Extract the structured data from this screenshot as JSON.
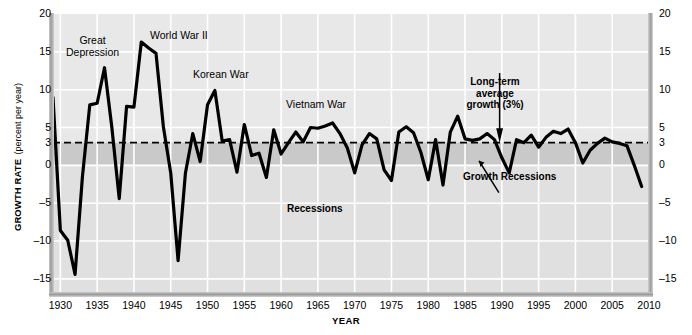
{
  "chart_data": {
    "type": "line",
    "title": "",
    "xlabel": "YEAR",
    "ylabel_main": "GROWTH RATE",
    "ylabel_sub": "(percent per year)",
    "xlim": [
      1929,
      2010
    ],
    "ylim": [
      -17,
      20
    ],
    "xticks": [
      1930,
      1935,
      1940,
      1945,
      1950,
      1955,
      1960,
      1965,
      1970,
      1975,
      1980,
      1985,
      1990,
      1995,
      2000,
      2005,
      2010
    ],
    "yticks": [
      20,
      15,
      10,
      5,
      3,
      0,
      -5,
      -10,
      -15
    ],
    "ytick_labels": [
      "20",
      "15",
      "10",
      "5",
      "3",
      "0",
      "-5",
      "-10",
      "-15"
    ],
    "grid": true,
    "legend_position": "none",
    "reference_line": {
      "label": "Long-term average growth (3%)",
      "value": 3,
      "style": "dashed"
    },
    "bands": [
      {
        "name": "Recessions",
        "from": -17,
        "to": 0,
        "color": "#e0e0e0"
      },
      {
        "name": "Growth Recessions",
        "from": 0,
        "to": 3,
        "color": "#c9c9c9"
      }
    ],
    "series": [
      {
        "name": "Real GDP growth rate",
        "color": "#000000",
        "x": [
          1929,
          1930,
          1931,
          1932,
          1933,
          1934,
          1935,
          1936,
          1937,
          1938,
          1939,
          1940,
          1941,
          1942,
          1943,
          1944,
          1945,
          1946,
          1947,
          1948,
          1949,
          1950,
          1951,
          1952,
          1953,
          1954,
          1955,
          1956,
          1957,
          1958,
          1959,
          1960,
          1961,
          1962,
          1963,
          1964,
          1965,
          1966,
          1967,
          1968,
          1969,
          1970,
          1971,
          1972,
          1973,
          1974,
          1975,
          1976,
          1977,
          1978,
          1979,
          1980,
          1981,
          1982,
          1983,
          1984,
          1985,
          1986,
          1987,
          1988,
          1989,
          1990,
          1991,
          1992,
          1993,
          1994,
          1995,
          1996,
          1997,
          1998,
          1999,
          2000,
          2001,
          2002,
          2003,
          2004,
          2005,
          2006,
          2007,
          2008,
          2009
        ],
        "values": [
          9.0,
          -8.6,
          -9.9,
          -14.4,
          -1.5,
          8.0,
          8.2,
          12.9,
          5.0,
          -4.4,
          7.8,
          7.7,
          16.3,
          15.5,
          14.8,
          5.1,
          -1.0,
          -12.6,
          -1.0,
          4.2,
          0.5,
          8.0,
          9.9,
          3.2,
          3.4,
          -0.9,
          5.4,
          1.3,
          1.6,
          -1.6,
          4.7,
          1.5,
          3.0,
          4.4,
          3.1,
          5.0,
          4.9,
          5.2,
          5.6,
          4.2,
          2.3,
          -1.0,
          2.7,
          4.2,
          3.5,
          -0.6,
          -2.0,
          4.4,
          5.1,
          4.3,
          1.7,
          -1.9,
          3.4,
          -2.6,
          4.4,
          6.5,
          3.5,
          3.3,
          3.5,
          4.2,
          3.4,
          1.0,
          -1.0,
          3.4,
          3.0,
          4.0,
          2.4,
          3.7,
          4.5,
          4.2,
          4.8,
          3.0,
          0.3,
          2.0,
          2.9,
          3.6,
          3.1,
          2.9,
          2.6,
          0.0,
          -2.8
        ],
        "y_at_3pct_ref": 3
      }
    ],
    "annotations": [
      {
        "name": "great-depression",
        "text_line1": "Great",
        "text_line2": "Depression",
        "x": 1932.5,
        "y": 14
      },
      {
        "name": "world-war-ii",
        "text": "World War II",
        "x": 1942,
        "y": 17.5
      },
      {
        "name": "korean-war",
        "text": "Korean War",
        "x": 1952,
        "y": 11.5
      },
      {
        "name": "vietnam-war",
        "text": "Vietnam War",
        "x": 1966,
        "y": 8.5
      },
      {
        "name": "long-term-average",
        "text_line1": "Long-term",
        "text_line2": "average",
        "text_line3": "growth (3%)",
        "x": 1988,
        "y": 11,
        "has_arrow": true
      },
      {
        "name": "growth-recessions",
        "text": "Growth Recessions",
        "x": 1990,
        "y": -2.5,
        "has_arrow": true
      },
      {
        "name": "recessions",
        "text": "Recessions",
        "x": 1966,
        "y": -9.5
      }
    ]
  },
  "axis": {
    "y_title_main": "GROWTH RATE",
    "y_title_sub": "(percent per year)",
    "x_title": "YEAR",
    "ytick_labels": [
      "20",
      "15",
      "10",
      "5",
      "3",
      "0",
      "–5",
      "–10",
      "–15"
    ],
    "xtick_labels": [
      "1930",
      "1935",
      "1940",
      "1945",
      "1950",
      "1955",
      "1960",
      "1965",
      "1970",
      "1975",
      "1980",
      "1985",
      "1990",
      "1995",
      "2000",
      "2005",
      "2010"
    ]
  },
  "annotations": {
    "great_depression_l1": "Great",
    "great_depression_l2": "Depression",
    "world_war_ii": "World War II",
    "korean_war": "Korean War",
    "vietnam_war": "Vietnam War",
    "long_term_l1": "Long-term",
    "long_term_l2": "average",
    "long_term_l3": "growth (3%)",
    "growth_recessions": "Growth Recessions",
    "recessions": "Recessions"
  },
  "colors": {
    "plot_background": "#e8e8e8",
    "recession_band": "#e0e0e0",
    "growth_recession_band": "#c9c9c9",
    "line": "#000000",
    "gridline": "#ffffff",
    "reference_line": "#000000"
  }
}
